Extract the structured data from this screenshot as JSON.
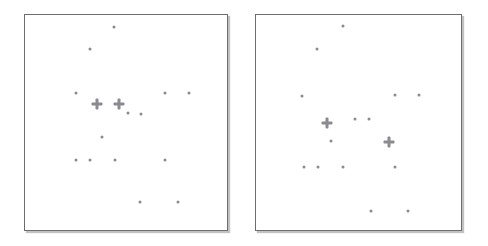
{
  "figure": {
    "title": "",
    "background_color": "#ffffff",
    "panel_border_color": "#6d6d6d",
    "marker_color": "#8a8a8f",
    "panel_count": 2
  },
  "chart_data": {
    "type": "scatter",
    "title": "",
    "xlabel": "",
    "ylabel": "",
    "grid": false,
    "legend_position": "none",
    "axis_ticks": false,
    "panels": [
      {
        "name": "left-panel",
        "label": "",
        "frame": {
          "x": 24,
          "y": 14,
          "width": 204,
          "height": 217
        },
        "xlim": [
          0,
          204
        ],
        "ylim": [
          0,
          217
        ],
        "series": [
          {
            "name": "small-points",
            "marker": "dot",
            "size": 3,
            "color": "#8a8a8f",
            "points": [
              {
                "x": 113,
                "y": 26
              },
              {
                "x": 89,
                "y": 48
              },
              {
                "x": 75,
                "y": 92
              },
              {
                "x": 164,
                "y": 92
              },
              {
                "x": 188,
                "y": 92
              },
              {
                "x": 127,
                "y": 112
              },
              {
                "x": 140,
                "y": 113
              },
              {
                "x": 101,
                "y": 136
              },
              {
                "x": 75,
                "y": 159
              },
              {
                "x": 89,
                "y": 159
              },
              {
                "x": 114,
                "y": 159
              },
              {
                "x": 164,
                "y": 159
              },
              {
                "x": 139,
                "y": 201
              },
              {
                "x": 177,
                "y": 201
              }
            ]
          },
          {
            "name": "cross-markers",
            "marker": "plus",
            "size": 11,
            "color": "#8a8a8f",
            "points": [
              {
                "x": 96,
                "y": 103
              },
              {
                "x": 118,
                "y": 103
              }
            ]
          }
        ]
      },
      {
        "name": "right-panel",
        "label": "",
        "frame": {
          "x": 255,
          "y": 14,
          "width": 207,
          "height": 217
        },
        "xlim": [
          0,
          207
        ],
        "ylim": [
          0,
          217
        ],
        "series": [
          {
            "name": "small-points",
            "marker": "dot",
            "size": 3,
            "color": "#8a8a8f",
            "points": [
              {
                "x": 342,
                "y": 25
              },
              {
                "x": 316,
                "y": 48
              },
              {
                "x": 301,
                "y": 95
              },
              {
                "x": 394,
                "y": 94
              },
              {
                "x": 418,
                "y": 94
              },
              {
                "x": 354,
                "y": 118
              },
              {
                "x": 368,
                "y": 118
              },
              {
                "x": 330,
                "y": 140
              },
              {
                "x": 303,
                "y": 166
              },
              {
                "x": 317,
                "y": 166
              },
              {
                "x": 342,
                "y": 166
              },
              {
                "x": 394,
                "y": 166
              },
              {
                "x": 370,
                "y": 210
              },
              {
                "x": 407,
                "y": 210
              }
            ]
          },
          {
            "name": "cross-markers",
            "marker": "plus",
            "size": 11,
            "color": "#8a8a8f",
            "points": [
              {
                "x": 326,
                "y": 122
              },
              {
                "x": 388,
                "y": 141
              }
            ]
          }
        ]
      }
    ]
  }
}
